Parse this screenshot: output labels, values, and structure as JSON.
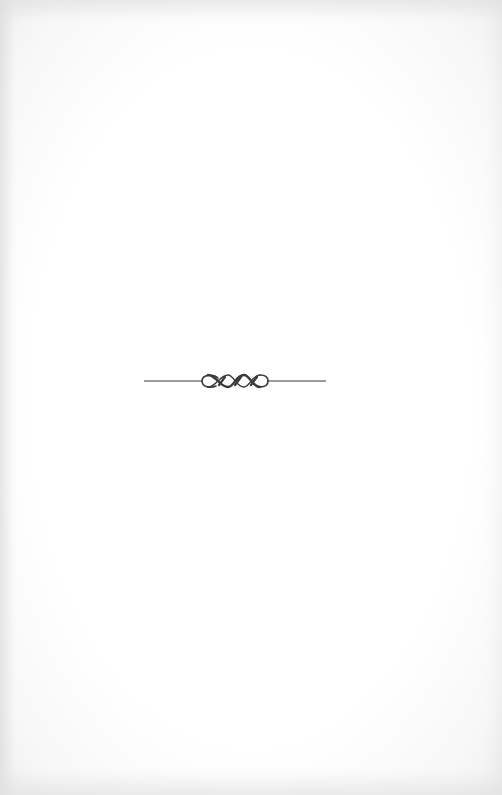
{
  "page": {
    "type": "blank book page",
    "ornament": {
      "icon": "rope-knot-divider",
      "description": "horizontal rule with twisted cord knot",
      "color": "#3a3a3a"
    }
  }
}
